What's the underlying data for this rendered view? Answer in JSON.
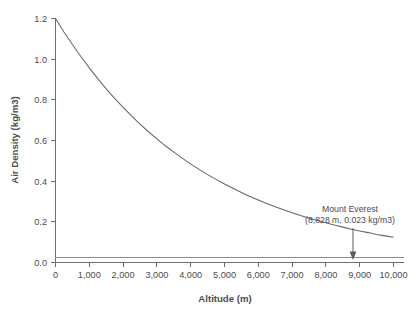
{
  "chart_data": {
    "type": "line",
    "title": "",
    "xlabel": "Altitude (m)",
    "ylabel": "Air Density (kg/m3)",
    "xlim": [
      0,
      10000
    ],
    "ylim": [
      0.0,
      1.2
    ],
    "grid": false,
    "legend": "none",
    "x_ticks": [
      0,
      1000,
      2000,
      3000,
      4000,
      5000,
      6000,
      7000,
      8000,
      9000,
      10000
    ],
    "x_tick_labels": [
      "0",
      "1,000",
      "2,000",
      "3,000",
      "4,000",
      "5,000",
      "6,000",
      "7,000",
      "8,000",
      "9,000",
      "10,000"
    ],
    "y_ticks": [
      0.0,
      0.2,
      0.4,
      0.6,
      0.8,
      1.0,
      1.2
    ],
    "y_tick_labels": [
      "0.0",
      "0.2",
      "0.4",
      "0.6",
      "0.8",
      "1.0",
      "1.2"
    ],
    "series": [
      {
        "name": "Air density vs altitude",
        "x": [
          0,
          250,
          500,
          750,
          1000,
          1250,
          1500,
          1750,
          2000,
          2250,
          2500,
          2750,
          3000,
          3250,
          3500,
          3750,
          4000,
          4250,
          4500,
          4750,
          5000,
          5250,
          5500,
          5750,
          6000,
          6250,
          6500,
          6750,
          7000,
          7250,
          7500,
          7750,
          8000,
          8250,
          8500,
          8750,
          8828,
          9000,
          9250,
          9500,
          9750,
          10000
        ],
        "values": [
          1.2,
          1.134,
          1.072,
          1.013,
          0.957,
          0.904,
          0.854,
          0.807,
          0.763,
          0.721,
          0.681,
          0.643,
          0.608,
          0.574,
          0.543,
          0.513,
          0.484,
          0.458,
          0.432,
          0.409,
          0.386,
          0.365,
          0.344,
          0.325,
          0.307,
          0.29,
          0.274,
          0.259,
          0.245,
          0.231,
          0.218,
          0.206,
          0.195,
          0.184,
          0.174,
          0.164,
          0.161,
          0.155,
          0.147,
          0.138,
          0.131,
          0.124
        ]
      },
      {
        "name": "reference-line",
        "constant_y": 0.025
      }
    ],
    "annotations": [
      {
        "label_line1": "Mount Everest",
        "label_line2": "(8,828 m, 0.023 kg/m3)",
        "x": 8828,
        "y": 0.023,
        "marker": "down-arrow"
      }
    ]
  }
}
